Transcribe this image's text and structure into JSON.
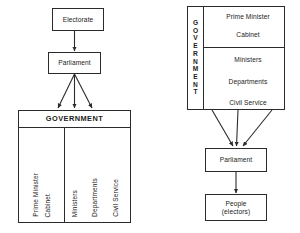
{
  "diagram": {
    "left": {
      "electorate": "Electorate",
      "parliament": "Parliament",
      "government_header": "GOVERNMENT",
      "executive_column": [
        "Prime Minister",
        "Cabinet"
      ],
      "administration_column": [
        "Ministers",
        "Departments",
        "Civil Service"
      ]
    },
    "right": {
      "government_label_letters": [
        "G",
        "O",
        "V",
        "E",
        "R",
        "N",
        "M",
        "E",
        "N",
        "T"
      ],
      "upper_items": [
        "Prime Minister",
        "Cabinet"
      ],
      "lower_items": [
        "Ministers",
        "Departments",
        "Civil Service"
      ],
      "parliament": "Parliament",
      "people_line1": "People",
      "people_line2": "(electors)"
    }
  },
  "colors": {
    "ink": "#2b2b2b",
    "background": "#ffffff"
  }
}
